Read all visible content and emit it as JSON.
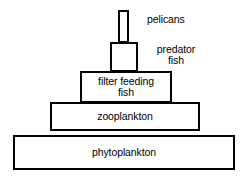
{
  "diagram": {
    "kind": "energy-pyramid",
    "title": "",
    "background_color": "#ffffff",
    "line_color": "#000000",
    "text_color": "#000000",
    "tiers": [
      {
        "id": "pelicans",
        "level": 5,
        "inside_label": "",
        "side_label": "pelicans"
      },
      {
        "id": "predator-fish",
        "level": 4,
        "inside_label": "",
        "side_label": "predator\nfish"
      },
      {
        "id": "filter-feeding-fish",
        "level": 3,
        "inside_label": "filter feeding\nfish",
        "side_label": ""
      },
      {
        "id": "zooplankton",
        "level": 2,
        "inside_label": "zooplankton",
        "side_label": ""
      },
      {
        "id": "phytoplankton",
        "level": 1,
        "inside_label": "phytoplankton",
        "side_label": ""
      }
    ]
  }
}
